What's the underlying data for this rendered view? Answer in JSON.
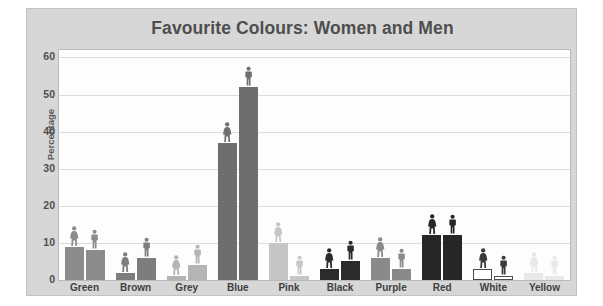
{
  "chart_data": {
    "type": "bar",
    "title": "Favourite Colours: Women and Men",
    "xlabel": "",
    "ylabel": "Percentage",
    "categories": [
      "Green",
      "Brown",
      "Grey",
      "Blue",
      "Pink",
      "Black",
      "Purple",
      "Red",
      "White",
      "Yellow"
    ],
    "series": [
      {
        "name": "Women",
        "values": [
          9,
          2,
          1,
          37,
          10,
          3,
          6,
          12,
          3,
          2
        ]
      },
      {
        "name": "Men",
        "values": [
          8,
          6,
          4,
          52,
          1,
          5,
          3,
          12,
          1,
          1
        ]
      }
    ],
    "ylim": [
      0,
      62
    ],
    "yticks": [
      0,
      10,
      20,
      30,
      40,
      50,
      60
    ],
    "ytick_labels": [
      "0",
      "10",
      "20",
      "30",
      "40",
      "50",
      "60"
    ],
    "grid": true,
    "legend": "none",
    "bar_colors": {
      "Green": "#8c8c8c",
      "Brown": "#7d7d7d",
      "Grey": "#b4b4b4",
      "Blue": "#6e6e6e",
      "Pink": "#c6c6c6",
      "Black": "#2b2b2b",
      "Purple": "#8a8a8a",
      "Red": "#262626",
      "White": "#ffffff",
      "Yellow": "#e8e8e8"
    },
    "marker_icons": [
      "female-figure-icon",
      "male-figure-icon"
    ]
  },
  "figure": {
    "background": "#d7d7d7",
    "plot_background": "#fdfdfd",
    "title_color": "#4e4e4e"
  }
}
